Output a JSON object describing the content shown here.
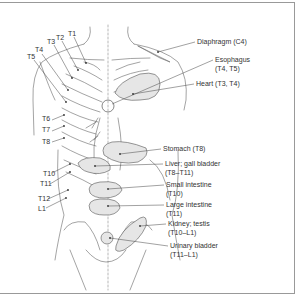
{
  "figure": {
    "organ_labels": [
      {
        "name": "Diaphragm",
        "segments": "(C4)",
        "line1": "Diaphragm (C4)"
      },
      {
        "name": "Esophagus",
        "segments": "(T4, T5)",
        "line1": "Esophagus",
        "line2": "(T4, T5)"
      },
      {
        "name": "Heart",
        "segments": "(T3, T4)",
        "line1": "Heart (T3, T4)"
      },
      {
        "name": "Stomach",
        "segments": "(T8)",
        "line1": "Stomach (T8)"
      },
      {
        "name": "Liver; gall bladder",
        "segments": "(T8–T11)",
        "line1": "Liver; gall bladder",
        "line2": "(T8–T11)"
      },
      {
        "name": "Small intestine",
        "segments": "(T10)",
        "line1": "Small intestine",
        "line2": "(T10)"
      },
      {
        "name": "Large intestine",
        "segments": "(T11)",
        "line1": "Large intestine",
        "line2": "(T11)"
      },
      {
        "name": "Kidney; testis",
        "segments": "(T10–L1)",
        "line1": "Kidney; testis",
        "line2": "(T10–L1)"
      },
      {
        "name": "Urinary bladder",
        "segments": "(T11–L1)",
        "line1": "Urinary bladder",
        "line2": "(T11–L1)"
      }
    ],
    "segment_labels": [
      "T1",
      "T2",
      "T3",
      "T4",
      "T5",
      "T6",
      "T7",
      "T8",
      "T10",
      "T11",
      "T12",
      "L1"
    ],
    "colors": {
      "line": "#555555",
      "organ_fill": "#e6e6e6",
      "frame": "#999999",
      "text": "#333333"
    }
  }
}
